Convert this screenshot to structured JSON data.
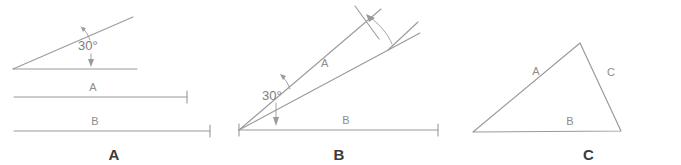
{
  "figure": {
    "width": 681,
    "height": 165,
    "background": "#ffffff",
    "line_color": "#9a9a9a",
    "label_color": "#8d8d8d",
    "caption_color": "#3a3a3a"
  },
  "panels": [
    {
      "id": "A",
      "caption": "A",
      "description": "Angle of 30 degrees between an inclined ray and a horizontal ray, with separate dimension lines A and B below",
      "angle_label": "30°",
      "segment_labels": {
        "upper": "A",
        "lower": "B"
      }
    },
    {
      "id": "B",
      "caption": "B",
      "description": "Two nearly coincident rays from a common vertex forming a 30 degree angle with a horizontal baseline; dimension arc near the far ends",
      "angle_label": "30°",
      "segment_labels": {
        "ray": "A",
        "baseline": "B"
      }
    },
    {
      "id": "C",
      "caption": "C",
      "description": "Scalene triangle with sides labelled A, B and C",
      "segment_labels": {
        "left": "A",
        "bottom": "B",
        "right": "C"
      }
    }
  ]
}
